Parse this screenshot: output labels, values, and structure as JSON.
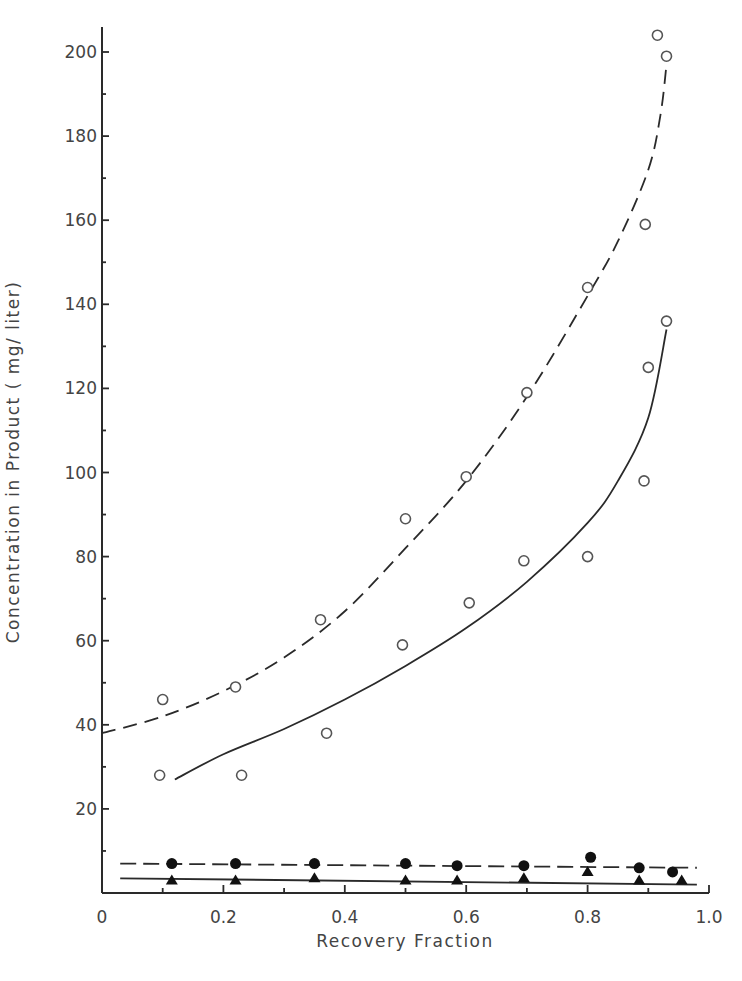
{
  "chart_data": {
    "type": "scatter",
    "title": "",
    "xlabel": "Recovery Fraction",
    "ylabel": "Concentration in Product ( mg/ liter)",
    "xlim": [
      0,
      1.0
    ],
    "ylim": [
      0,
      205
    ],
    "x_ticks": [
      0,
      0.1,
      0.2,
      0.3,
      0.4,
      0.5,
      0.6,
      0.7,
      0.8,
      0.9,
      1.0
    ],
    "x_tick_labels": [
      "0",
      "",
      "0.2",
      "",
      "0.4",
      "",
      "0.6",
      "",
      "0.8",
      "",
      "1.0"
    ],
    "y_ticks": [
      0,
      10,
      20,
      30,
      40,
      50,
      60,
      70,
      80,
      90,
      100,
      110,
      120,
      130,
      140,
      150,
      160,
      170,
      180,
      190,
      200
    ],
    "y_tick_labels": [
      "",
      "",
      "20",
      "",
      "40",
      "",
      "60",
      "",
      "80",
      "",
      "100",
      "",
      "120",
      "",
      "140",
      "",
      "160",
      "",
      "180",
      "",
      "200"
    ],
    "grid": false,
    "legend": null,
    "series": [
      {
        "name": "Open circles (upper, dashed fit)",
        "marker": "open-circle",
        "line": "dashed",
        "x": [
          0.1,
          0.22,
          0.36,
          0.5,
          0.6,
          0.7,
          0.8,
          0.895,
          0.915,
          0.93
        ],
        "y": [
          46,
          49,
          65,
          89,
          99,
          119,
          144,
          159,
          204,
          199
        ],
        "fit": {
          "x": [
            0.0,
            0.1,
            0.2,
            0.3,
            0.4,
            0.5,
            0.6,
            0.7,
            0.8,
            0.85,
            0.9,
            0.92,
            0.93
          ],
          "y": [
            38,
            42,
            48,
            56,
            67,
            82,
            98,
            118,
            142,
            155,
            172,
            185,
            197
          ]
        }
      },
      {
        "name": "Open circles (lower, solid fit)",
        "marker": "open-circle",
        "line": "solid",
        "x": [
          0.095,
          0.23,
          0.37,
          0.495,
          0.605,
          0.695,
          0.8,
          0.893,
          0.9,
          0.93
        ],
        "y": [
          28,
          28,
          38,
          59,
          69,
          79,
          80,
          98,
          125,
          136
        ],
        "fit": {
          "x": [
            0.12,
            0.2,
            0.3,
            0.4,
            0.5,
            0.6,
            0.7,
            0.8,
            0.85,
            0.9,
            0.93
          ],
          "y": [
            27,
            33,
            39,
            46,
            54,
            63,
            74,
            88,
            98,
            113,
            134
          ]
        }
      },
      {
        "name": "Filled circles (dashed fit)",
        "marker": "filled-circle",
        "line": "dashed",
        "x": [
          0.115,
          0.22,
          0.35,
          0.5,
          0.585,
          0.695,
          0.805,
          0.885,
          0.94
        ],
        "y": [
          7,
          7,
          7,
          7,
          6.5,
          6.5,
          8.5,
          6,
          5
        ],
        "fit": {
          "x": [
            0.03,
            0.98
          ],
          "y": [
            7,
            6
          ]
        }
      },
      {
        "name": "Filled triangles (solid fit)",
        "marker": "filled-triangle",
        "line": "solid",
        "x": [
          0.115,
          0.22,
          0.35,
          0.5,
          0.585,
          0.695,
          0.8,
          0.885,
          0.955
        ],
        "y": [
          3,
          3,
          3.5,
          3,
          3,
          3.5,
          5,
          3,
          3
        ],
        "fit": {
          "x": [
            0.03,
            0.98
          ],
          "y": [
            3.5,
            2
          ]
        }
      }
    ]
  }
}
